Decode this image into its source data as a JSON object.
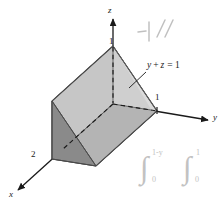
{
  "figure": {
    "background_color": "#ffffff",
    "ink_color": "#1a1a1a",
    "pencil_color": "#c2c2c2",
    "faces": {
      "top_color": "#c9c9c9",
      "front_lower_color": "#b5b5b5",
      "left_triangle_color": "#8a8a8a",
      "right_slant_color": "#d2d2d2",
      "edge_color": "#4a4a4a"
    }
  },
  "axes": {
    "z": {
      "label": "z",
      "tick_label": "1"
    },
    "y": {
      "label": "y",
      "tick_label": "1"
    },
    "x": {
      "label": "x",
      "tick_label": "2"
    }
  },
  "annotations": {
    "plane_equation": "y + z = 1",
    "plane_equation_parts": {
      "y": "y",
      "plus": "+",
      "z": "z",
      "equals": "= 1"
    }
  },
  "handwriting": {
    "top_mark": "-|",
    "top_slashes": "//",
    "integral_one": {
      "sign": "∫",
      "upper": "1-y",
      "lower": "0"
    },
    "integral_two": {
      "sign": "∫",
      "upper": "1",
      "lower": "0"
    }
  }
}
